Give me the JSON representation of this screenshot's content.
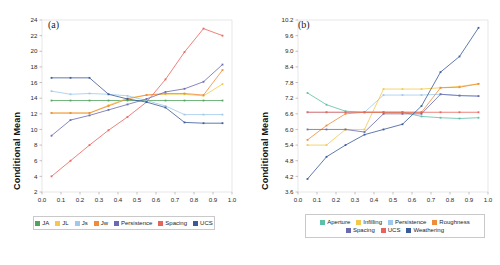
{
  "figure": {
    "background": "#ffffff",
    "panels": [
      {
        "tag": "(a)",
        "ylabel": "Conditional Mean",
        "legend_rows": [
          [
            "JA",
            "JL",
            "Js",
            "Jw",
            "Persistence",
            "Spacing",
            "UCS"
          ]
        ]
      },
      {
        "tag": "(b)",
        "ylabel": "Conditional Mean",
        "legend_rows": [
          [
            "Aperture",
            "Infilling",
            "Persistence",
            "Roughness"
          ],
          [
            "Spacing",
            "UCS",
            "Weathering"
          ]
        ]
      }
    ]
  },
  "chart_data": [
    {
      "type": "line",
      "title": "(a)",
      "xlabel": "",
      "ylabel": "Conditional Mean",
      "xlim": [
        0.0,
        1.0
      ],
      "ylim": [
        2,
        24
      ],
      "xticks": [
        "0.0",
        "0.1",
        "0.2",
        "0.3",
        "0.4",
        "0.5",
        "0.6",
        "0.7",
        "0.8",
        "0.9",
        "1.0"
      ],
      "yticks": [
        "2",
        "4",
        "6",
        "8",
        "10",
        "12",
        "14",
        "16",
        "18",
        "20",
        "22",
        "24"
      ],
      "grid": false,
      "legend_position": "below",
      "x": [
        0.05,
        0.15,
        0.25,
        0.35,
        0.45,
        0.55,
        0.65,
        0.75,
        0.85,
        0.95
      ],
      "series": [
        {
          "name": "JA",
          "color": "#4fa35c",
          "values": [
            13.7,
            13.7,
            13.7,
            13.7,
            13.7,
            13.7,
            13.7,
            13.7,
            13.7,
            13.7
          ]
        },
        {
          "name": "JL",
          "color": "#f2c94c",
          "values": [
            12.1,
            12.1,
            12.1,
            13.1,
            14.0,
            14.4,
            14.5,
            14.5,
            14.3,
            15.8
          ]
        },
        {
          "name": "Js",
          "color": "#9ec9ea",
          "values": [
            14.9,
            14.5,
            14.6,
            14.5,
            14.3,
            13.7,
            13.0,
            11.9,
            11.9,
            11.9
          ]
        },
        {
          "name": "Jw",
          "color": "#ef8b3c",
          "values": [
            12.1,
            12.1,
            12.1,
            13.0,
            13.9,
            14.4,
            14.6,
            14.6,
            14.4,
            17.6
          ]
        },
        {
          "name": "Persistence",
          "color": "#6a6ab0",
          "values": [
            9.2,
            11.2,
            11.8,
            12.5,
            13.2,
            13.9,
            14.8,
            15.2,
            16.1,
            18.3
          ]
        },
        {
          "name": "Spacing",
          "color": "#e8635c",
          "values": [
            4.0,
            6.0,
            8.0,
            9.9,
            11.6,
            13.5,
            16.4,
            19.9,
            22.9,
            22.0
          ]
        },
        {
          "name": "UCS",
          "color": "#3b5a9a",
          "values": [
            16.6,
            16.6,
            16.6,
            14.5,
            13.9,
            13.5,
            12.8,
            10.9,
            10.8,
            10.8
          ]
        }
      ]
    },
    {
      "type": "line",
      "title": "(b)",
      "xlabel": "",
      "ylabel": "Conditional Mean",
      "xlim": [
        0.0,
        1.0
      ],
      "ylim": [
        3.6,
        10.2
      ],
      "xticks": [
        "0.0",
        "0.1",
        "0.2",
        "0.3",
        "0.4",
        "0.5",
        "0.6",
        "0.7",
        "0.8",
        "0.9",
        "1.0"
      ],
      "yticks": [
        "3.6",
        "4.2",
        "4.8",
        "5.4",
        "6.0",
        "6.6",
        "7.2",
        "7.8",
        "8.4",
        "9.0",
        "9.6",
        "10.2"
      ],
      "grid": false,
      "legend_position": "below",
      "x": [
        0.05,
        0.15,
        0.25,
        0.35,
        0.45,
        0.55,
        0.65,
        0.75,
        0.85,
        0.95
      ],
      "series": [
        {
          "name": "Aperture",
          "color": "#5cbfa8",
          "values": [
            7.4,
            6.95,
            6.7,
            6.66,
            6.66,
            6.66,
            6.5,
            6.45,
            6.42,
            6.45
          ]
        },
        {
          "name": "Infilling",
          "color": "#f2c94c",
          "values": [
            5.4,
            5.4,
            6.0,
            6.0,
            7.55,
            7.55,
            7.55,
            7.6,
            7.65,
            7.75
          ]
        },
        {
          "name": "Persistence",
          "color": "#9ec9ea",
          "values": [
            6.66,
            6.66,
            6.66,
            6.66,
            7.32,
            7.32,
            7.32,
            7.35,
            7.3,
            7.28
          ]
        },
        {
          "name": "Roughness",
          "color": "#ef8b3c",
          "values": [
            5.6,
            6.15,
            6.6,
            6.66,
            6.66,
            6.66,
            6.66,
            7.6,
            7.62,
            7.75
          ]
        },
        {
          "name": "Spacing",
          "color": "#6a6ab0",
          "values": [
            6.0,
            6.0,
            6.0,
            5.9,
            6.6,
            6.6,
            6.6,
            7.35,
            7.3,
            7.28
          ]
        },
        {
          "name": "UCS",
          "color": "#e8635c",
          "values": [
            6.66,
            6.66,
            6.66,
            6.66,
            6.66,
            6.66,
            6.66,
            6.66,
            6.66,
            6.66
          ]
        },
        {
          "name": "Weathering",
          "color": "#3b5a9a",
          "values": [
            4.1,
            4.95,
            5.4,
            5.8,
            6.0,
            6.2,
            6.9,
            8.2,
            8.8,
            9.9
          ]
        }
      ]
    }
  ]
}
